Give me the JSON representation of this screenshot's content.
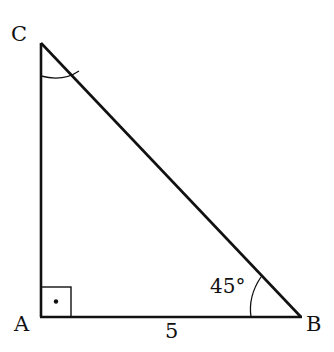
{
  "diagram": {
    "type": "right-triangle",
    "vertices": {
      "A": {
        "label": "A",
        "x": 41,
        "y": 317
      },
      "B": {
        "label": "B",
        "x": 301,
        "y": 317
      },
      "C": {
        "label": "C",
        "x": 41,
        "y": 43
      }
    },
    "side_labels": {
      "AB": "5"
    },
    "angle_labels": {
      "B": "45°"
    },
    "right_angle_at": "A",
    "colors": {
      "stroke": "#111111",
      "background": "#ffffff"
    }
  }
}
